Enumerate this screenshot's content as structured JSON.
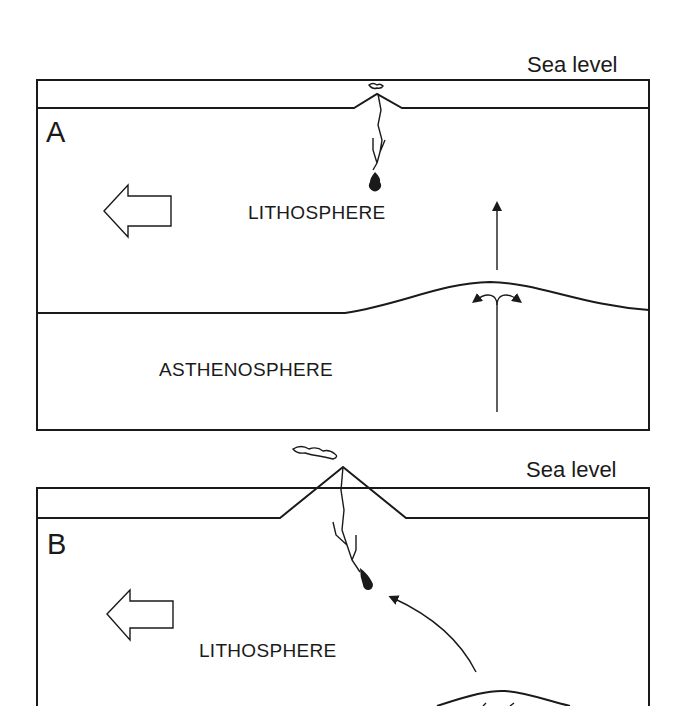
{
  "panel_a": {
    "letter": "A",
    "sea_level_label": "Sea level",
    "upper_layer_label": "LITHOSPHERE",
    "lower_layer_label": "ASTHENOSPHERE",
    "motion_arrow": "hollow-arrow-left",
    "features": [
      "small volcano at ridge",
      "magma chamber",
      "vertical upwelling arrow",
      "diverging flow arrows at asthenosphere bulge"
    ]
  },
  "panel_b": {
    "letter": "B",
    "sea_level_label": "Sea level",
    "upper_layer_label": "LITHOSPHERE",
    "motion_arrow": "hollow-arrow-left",
    "features": [
      "large volcano rising above sea level",
      "eruption plume",
      "magma chamber",
      "curved arrow from hotspot",
      "asthenosphere bulge (cropped)"
    ]
  },
  "colors": {
    "ink": "#1a1a1a",
    "background": "#ffffff"
  }
}
